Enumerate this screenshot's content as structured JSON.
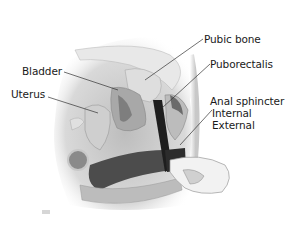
{
  "diagram": {
    "type": "anatomical-illustration",
    "labels": [
      {
        "id": "pubic-bone",
        "text": "Pubic bone"
      },
      {
        "id": "bladder",
        "text": "Bladder"
      },
      {
        "id": "puborectalis",
        "text": "Puborectalis"
      },
      {
        "id": "uterus",
        "text": "Uterus"
      },
      {
        "id": "anal-sphincter",
        "text": "Anal sphincter"
      },
      {
        "id": "internal",
        "text": "Internal"
      },
      {
        "id": "external",
        "text": "External"
      }
    ],
    "colors": {
      "background": "#ffffff",
      "label_text": "#1a1a1a",
      "leader_line": "#333333",
      "sphincter_dark": "#1e1e1e",
      "tissue_mid": "#9a9a9a",
      "tissue_light": "#d8d8d8"
    }
  }
}
